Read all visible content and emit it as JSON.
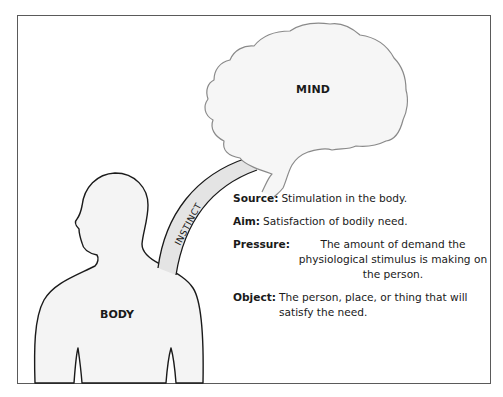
{
  "figure": {
    "mind_label": "MIND",
    "body_label": "BODY",
    "connector_label": "INSTINCT",
    "colors": {
      "frame": "#5a5a5a",
      "outline": "#1a1a1a",
      "brain_outline": "#8a8a8a",
      "fill_light": "#f4f4f4",
      "connector_fill": "#e4e4e4"
    }
  },
  "definitions": [
    {
      "term": "Source:",
      "description": "Stimulation in the body."
    },
    {
      "term": "Aim:",
      "description": "Satisfaction of bodily need."
    },
    {
      "term": "Pressure:",
      "description": "The amount of demand the physiological stimulus is making on the person."
    },
    {
      "term": "Object:",
      "description": "The person, place, or thing that will satisfy the need."
    }
  ]
}
